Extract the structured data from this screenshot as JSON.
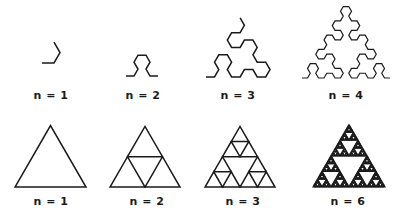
{
  "figure": {
    "rows": [
      {
        "name": "sierpinski-arrowhead-curve",
        "items": [
          {
            "label": "n = 1",
            "order": 1,
            "x": 42,
            "y": 63,
            "size": 18,
            "label_x": 51,
            "label_y": 89
          },
          {
            "label": "n = 2",
            "order": 2,
            "x": 126,
            "y": 76,
            "size": 32,
            "label_x": 143,
            "label_y": 89
          },
          {
            "label": "n = 3",
            "order": 3,
            "x": 206,
            "y": 77,
            "size": 64,
            "label_x": 238,
            "label_y": 89
          },
          {
            "label": "n = 4",
            "order": 4,
            "x": 302,
            "y": 78,
            "size": 88,
            "label_x": 346,
            "label_y": 89
          }
        ]
      },
      {
        "name": "sierpinski-triangle",
        "items": [
          {
            "label": "n = 1",
            "order": 1,
            "x": 15,
            "y": 187,
            "size": 71,
            "label_x": 51,
            "label_y": 195
          },
          {
            "label": "n = 2",
            "order": 2,
            "x": 110,
            "y": 187,
            "size": 70,
            "label_x": 147,
            "label_y": 195
          },
          {
            "label": "n = 3",
            "order": 3,
            "x": 205,
            "y": 187,
            "size": 70,
            "label_x": 243,
            "label_y": 195
          },
          {
            "label": "n = 6",
            "order": 6,
            "x": 313,
            "y": 187,
            "size": 72,
            "label_x": 348,
            "label_y": 195
          }
        ]
      }
    ],
    "stroke_color": "#1a1a1a"
  }
}
